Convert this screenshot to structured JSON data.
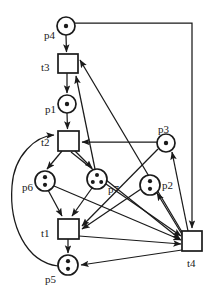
{
  "diagram": {
    "type": "petri-net",
    "width": 212,
    "height": 291,
    "colors": {
      "stroke": "#1a1a1a",
      "fill": "#ffffff",
      "token": "#1a1a1a",
      "background": "#ffffff"
    },
    "places": [
      {
        "id": "p4",
        "label": "p4",
        "cx": 66,
        "cy": 26,
        "r": 9,
        "tokens": 1,
        "label_x": 44,
        "label_y": 30
      },
      {
        "id": "p1",
        "label": "p1",
        "cx": 67,
        "cy": 104,
        "r": 9,
        "tokens": 1,
        "label_x": 45,
        "label_y": 104
      },
      {
        "id": "p3",
        "label": "p3",
        "cx": 166,
        "cy": 143,
        "r": 9,
        "tokens": 1,
        "label_x": 158,
        "label_y": 124
      },
      {
        "id": "p6",
        "label": "p6",
        "cx": 45,
        "cy": 181,
        "r": 10,
        "tokens": 2,
        "label_x": 22,
        "label_y": 182
      },
      {
        "id": "p7",
        "label": "p7",
        "cx": 97,
        "cy": 179,
        "r": 10,
        "tokens": 3,
        "label_x": 108,
        "label_y": 184
      },
      {
        "id": "p2",
        "label": "p2",
        "cx": 150,
        "cy": 185,
        "r": 10,
        "tokens": 2,
        "label_x": 162,
        "label_y": 180
      },
      {
        "id": "p5",
        "label": "p5",
        "cx": 68,
        "cy": 265,
        "r": 10,
        "tokens": 2,
        "label_x": 45,
        "label_y": 274
      }
    ],
    "transitions": [
      {
        "id": "t3",
        "label": "t3",
        "x": 58,
        "y": 54,
        "w": 20,
        "h": 19,
        "label_x": 41,
        "label_y": 62
      },
      {
        "id": "t2",
        "label": "t2",
        "x": 58,
        "y": 131,
        "w": 21,
        "h": 20,
        "label_x": 41,
        "label_y": 137
      },
      {
        "id": "t1",
        "label": "t1",
        "x": 58,
        "y": 219,
        "w": 21,
        "h": 20,
        "label_x": 41,
        "label_y": 228
      },
      {
        "id": "t4",
        "label": "t4",
        "x": 182,
        "y": 231,
        "w": 20,
        "h": 20,
        "label_x": 187,
        "label_y": 258
      }
    ],
    "arcs": [
      {
        "from": "p4",
        "to": "t3",
        "kind": "straight"
      },
      {
        "from": "t3",
        "to": "p1",
        "kind": "straight"
      },
      {
        "from": "p1",
        "to": "t2",
        "kind": "straight"
      },
      {
        "from": "t2",
        "to": "p6",
        "kind": "straight"
      },
      {
        "from": "t2",
        "to": "p7",
        "kind": "straight"
      },
      {
        "from": "p6",
        "to": "t1",
        "kind": "straight"
      },
      {
        "from": "p7",
        "to": "t1",
        "kind": "straight"
      },
      {
        "from": "t1",
        "to": "p5",
        "kind": "straight"
      },
      {
        "from": "p5",
        "to": "t2",
        "kind": "curve-left"
      },
      {
        "from": "p3",
        "to": "t2",
        "kind": "straight"
      },
      {
        "from": "p3",
        "to": "t1",
        "kind": "straight"
      },
      {
        "from": "p2",
        "to": "t1",
        "kind": "straight"
      },
      {
        "from": "p4",
        "to": "t4",
        "kind": "orthogonal-top-right"
      },
      {
        "from": "t4",
        "to": "p5",
        "kind": "straight"
      },
      {
        "from": "t4",
        "to": "p2",
        "kind": "straight"
      },
      {
        "from": "t4",
        "to": "p3",
        "kind": "straight"
      },
      {
        "from": "t4",
        "to": "t3",
        "kind": "straight"
      },
      {
        "from": "p7",
        "to": "t4",
        "kind": "straight"
      },
      {
        "from": "p6",
        "to": "t4",
        "kind": "straight"
      },
      {
        "from": "t1",
        "to": "t4",
        "kind": "straight"
      },
      {
        "from": "p7",
        "to": "t3",
        "kind": "straight"
      },
      {
        "from": "t2",
        "to": "t4",
        "kind": "straight"
      }
    ]
  }
}
